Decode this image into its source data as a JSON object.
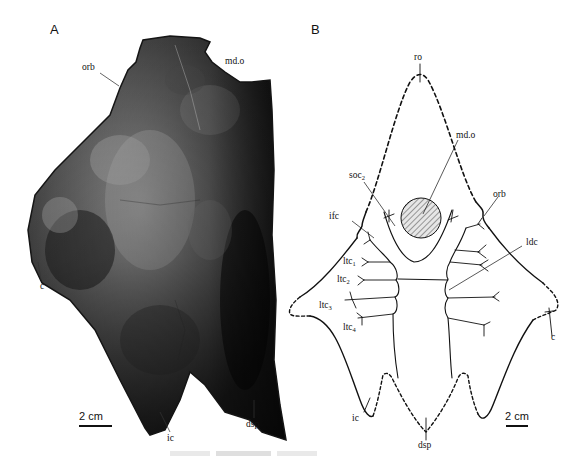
{
  "figure": {
    "panel_a": {
      "letter": "A",
      "type": "photograph",
      "labels": {
        "orb": "orb",
        "md_o": "md.o",
        "c": "c",
        "ic": "ic",
        "dsp": "dsp"
      },
      "scale_bar": "2 cm"
    },
    "panel_b": {
      "letter": "B",
      "type": "interpretive line drawing",
      "labels": {
        "ro": "ro",
        "md_o": "md.o",
        "soc": "soc",
        "soc_sub": "2",
        "orb": "orb",
        "ifc": "ifc",
        "ldc": "ldc",
        "ltc": "ltc",
        "ltc1_sub": "1",
        "ltc2_sub": "2",
        "ltc3_sub": "3",
        "ltc4_sub": "4",
        "c": "c",
        "ic": "ic",
        "dsp": "dsp"
      },
      "scale_bar": "2 cm"
    },
    "colors": {
      "ink": "#111111",
      "background": "#ffffff",
      "hatch_fill": "#d8d8d8"
    }
  }
}
